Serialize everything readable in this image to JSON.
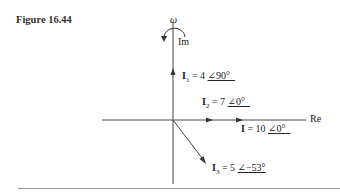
{
  "figure": {
    "label": "Figure 16.44"
  },
  "diagram": {
    "type": "phasor",
    "axes": {
      "real_label": "Re",
      "imag_label": "Im"
    },
    "rotation": {
      "symbol": "ω",
      "direction": "counterclockwise"
    },
    "phasors": [
      {
        "name": "I",
        "sub": "1",
        "magnitude": "4",
        "angle": "90°",
        "eq": "= 4"
      },
      {
        "name": "I",
        "sub": "2",
        "magnitude": "7",
        "angle": "0°",
        "eq": "= 7"
      },
      {
        "name": "I",
        "sub": "",
        "magnitude": "10",
        "angle": "0°",
        "eq": "= 10"
      },
      {
        "name": "I",
        "sub": "3",
        "magnitude": "5",
        "angle": "−53°",
        "eq": "= 5"
      }
    ]
  }
}
